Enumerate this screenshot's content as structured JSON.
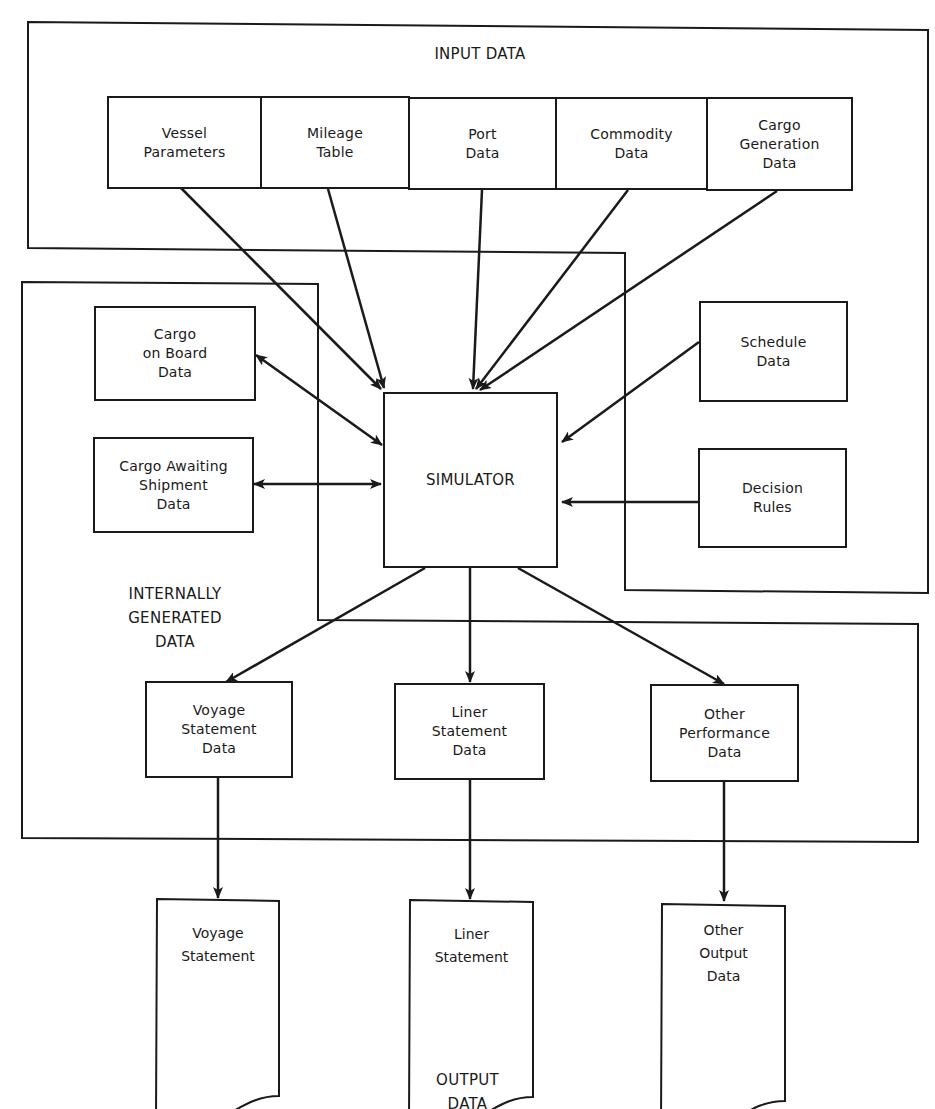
{
  "groups": {
    "input": {
      "label": "INPUT DATA"
    },
    "internal": {
      "label": "INTERNALLY\nGENERATED\nDATA"
    },
    "output": {
      "label": "OUTPUT\nDATA"
    }
  },
  "input_boxes": [
    {
      "label": "Vessel\nParameters"
    },
    {
      "label": "Mileage\nTable"
    },
    {
      "label": "Port\nData"
    },
    {
      "label": "Commodity\nData"
    },
    {
      "label": "Cargo\nGeneration\nData"
    }
  ],
  "internal_boxes": [
    {
      "label": "Cargo\non Board\nData"
    },
    {
      "label": "Cargo Awaiting\nShipment\nData"
    }
  ],
  "right_boxes": [
    {
      "label": "Schedule\nData"
    },
    {
      "label": "Decision\nRules"
    }
  ],
  "simulator": {
    "label": "SIMULATOR"
  },
  "statement_boxes": [
    {
      "label": "Voyage\nStatement\nData"
    },
    {
      "label": "Liner\nStatement\nData"
    },
    {
      "label": "Other\nPerformance\nData"
    }
  ],
  "output_docs": [
    {
      "label": "Voyage\nStatement"
    },
    {
      "label": "Liner\nStatement"
    },
    {
      "label": "Other\nOutput\nData"
    }
  ]
}
